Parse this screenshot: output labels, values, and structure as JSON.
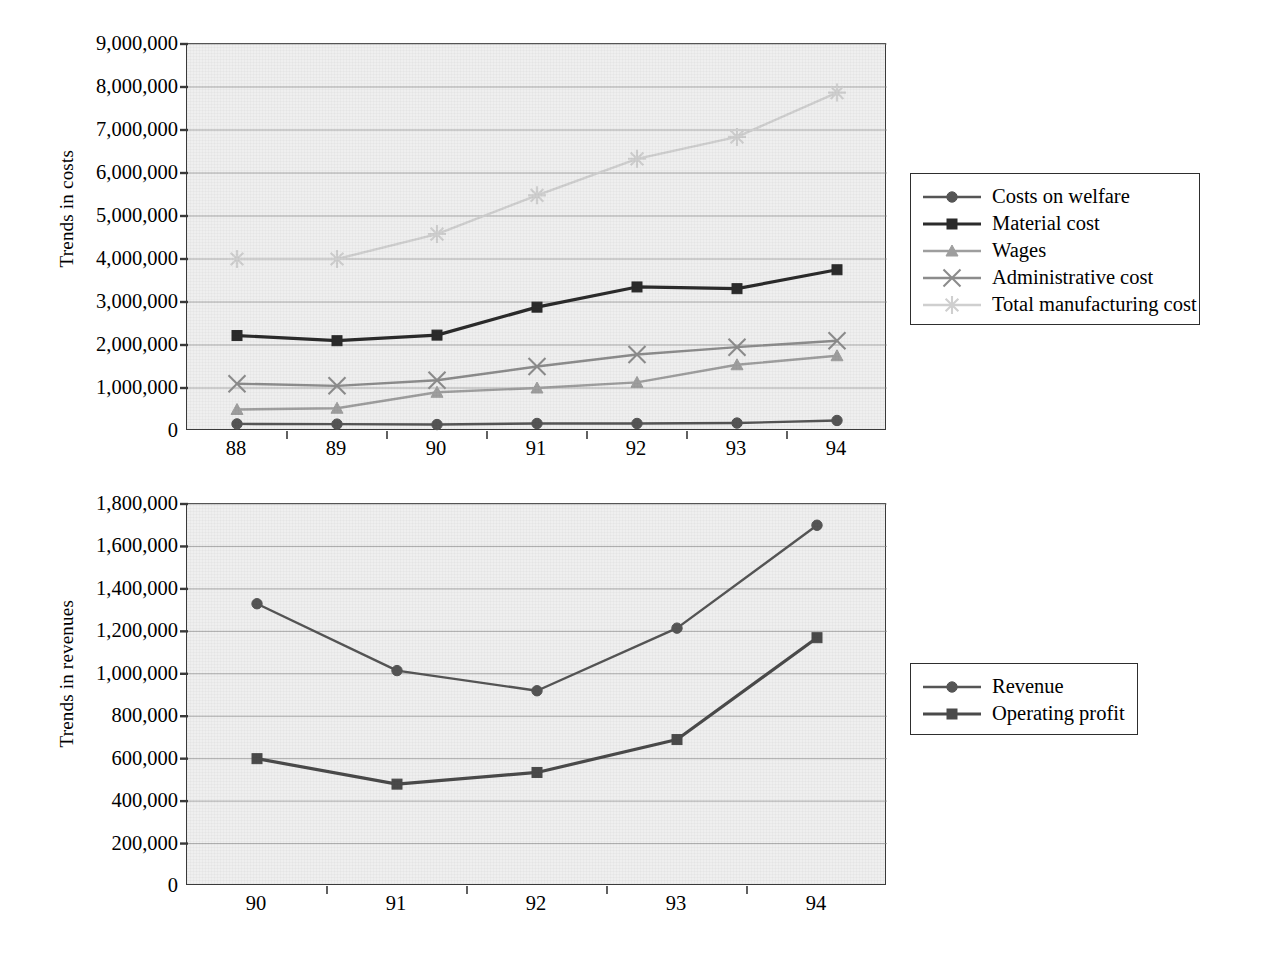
{
  "figure": {
    "background": "#ffffff",
    "plot_background": "#efefef",
    "gridline_color": "#8a8a8a",
    "axis_color": "#3a3a3a"
  },
  "charts": [
    {
      "id": "trends-in-costs",
      "type": "line",
      "title": "",
      "xlabel": "",
      "ylabel": "Trends in costs",
      "categories": [
        "88",
        "89",
        "90",
        "91",
        "92",
        "93",
        "94"
      ],
      "ylim": [
        0,
        9000000
      ],
      "ytick_values": [
        0,
        1000000,
        2000000,
        3000000,
        4000000,
        5000000,
        6000000,
        7000000,
        8000000,
        9000000
      ],
      "ytick_labels": [
        "0",
        "1,000,000",
        "2,000,000",
        "3,000,000",
        "4,000,000",
        "5,000,000",
        "6,000,000",
        "7,000,000",
        "8,000,000",
        "9,000,000"
      ],
      "grid": true,
      "legend_position": "right",
      "series": [
        {
          "name": "Costs on welfare",
          "marker": "circle",
          "color": "#555555",
          "values": [
            165000,
            160000,
            150000,
            175000,
            175000,
            185000,
            245000
          ]
        },
        {
          "name": "Material cost",
          "marker": "square",
          "color": "#2b2b2b",
          "values": [
            2220000,
            2100000,
            2230000,
            2880000,
            3350000,
            3310000,
            3750000
          ]
        },
        {
          "name": "Wages",
          "marker": "triangle",
          "color": "#9e9e9e",
          "values": [
            500000,
            530000,
            900000,
            1000000,
            1130000,
            1540000,
            1750000
          ]
        },
        {
          "name": "Administrative cost",
          "marker": "x",
          "color": "#8c8c8c",
          "values": [
            1100000,
            1050000,
            1180000,
            1500000,
            1780000,
            1950000,
            2100000
          ]
        },
        {
          "name": "Total manufacturing cost",
          "marker": "asterisk",
          "color": "#cfcfcf",
          "values": [
            4000000,
            4000000,
            4580000,
            5480000,
            6330000,
            6840000,
            7870000
          ]
        }
      ]
    },
    {
      "id": "trends-in-revenues",
      "type": "line",
      "title": "",
      "xlabel": "",
      "ylabel": "Trends in revenues",
      "categories": [
        "90",
        "91",
        "92",
        "93",
        "94"
      ],
      "ylim": [
        0,
        1800000
      ],
      "ytick_values": [
        0,
        200000,
        400000,
        600000,
        800000,
        1000000,
        1200000,
        1400000,
        1600000,
        1800000
      ],
      "ytick_labels": [
        "0",
        "200,000",
        "400,000",
        "600,000",
        "800,000",
        "1,000,000",
        "1,200,000",
        "1,400,000",
        "1,600,000",
        "1,800,000"
      ],
      "grid": true,
      "legend_position": "right",
      "series": [
        {
          "name": "Revenue",
          "marker": "circle",
          "color": "#555555",
          "values": [
            1330000,
            1015000,
            920000,
            1215000,
            1700000
          ]
        },
        {
          "name": "Operating profit",
          "marker": "square",
          "color": "#4a4a4a",
          "values": [
            600000,
            480000,
            535000,
            690000,
            1170000
          ]
        }
      ]
    }
  ]
}
